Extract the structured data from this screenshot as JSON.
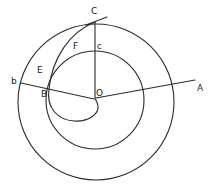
{
  "diagram": {
    "type": "geometric-construction",
    "labels": {
      "C": "C",
      "c": "c",
      "F": "F",
      "E": "E",
      "b": "b",
      "B": "B",
      "O": "O",
      "A": "A"
    },
    "elements": {
      "outer_circle": {
        "cx": 96,
        "cy": 102,
        "r": 78
      },
      "inner_circle": {
        "cx": 95,
        "cy": 100,
        "r": 49
      },
      "line_OA": {
        "from": "O",
        "to": "A"
      },
      "line_Ob": {
        "from": "O",
        "to": "b",
        "through": "B"
      },
      "line_OC": {
        "from": "O",
        "to": "C",
        "through": "c"
      },
      "tangent_at_C": true,
      "spiral": {
        "path": [
          "C",
          "F",
          "E",
          "B",
          "O"
        ]
      }
    },
    "stroke_color": "#2a2a2a",
    "background": "#ffffff"
  }
}
